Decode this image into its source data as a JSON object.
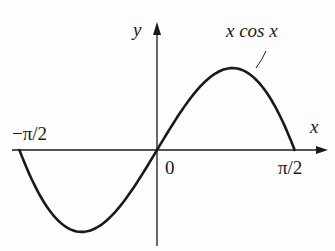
{
  "chart_data": {
    "type": "line",
    "title": "",
    "function": "x cos x",
    "series": [
      {
        "name": "x cos x",
        "x": [
          -1.5708,
          -1.2,
          -0.8603,
          -0.5,
          0,
          0.5,
          0.8603,
          1.2,
          1.5708
        ],
        "values": [
          0,
          -0.4348,
          -0.5611,
          -0.4388,
          0,
          0.4388,
          0.5611,
          0.4348,
          0
        ]
      }
    ],
    "xlabel": "x",
    "ylabel": "y",
    "xlim": [
      -1.5708,
      1.5708
    ],
    "ylim": [
      -0.65,
      0.87
    ],
    "x_tick_labels": [
      "−π/2",
      "0",
      "π/2"
    ],
    "grid": false,
    "legend": "none",
    "annotations": [
      {
        "text": "x cos x",
        "points_to": "curve near maximum, right side"
      }
    ]
  },
  "labels": {
    "y_axis": "y",
    "x_axis": "x",
    "neg_half_pi": "−π/2",
    "origin": "0",
    "half_pi": "π/2",
    "curve_label": "x cos x"
  },
  "colors": {
    "ink": "#1a1a1a",
    "background": "#fdfdfd"
  }
}
